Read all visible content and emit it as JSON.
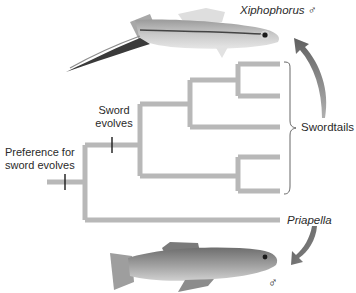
{
  "diagram": {
    "type": "phylogenetic-tree",
    "labels": {
      "top_species": "Xiphophorus ♂",
      "bottom_species": "Priapella",
      "bottom_sex": "♂",
      "clade": "Swordtails",
      "sword_event": [
        "Sword",
        "evolves"
      ],
      "preference_event": [
        "Preference for",
        "sword evolves"
      ]
    },
    "tree": {
      "root_event": "Preference for sword evolves",
      "children": [
        {
          "name": "Swordtails",
          "event": "Sword evolves",
          "taxa_count": 5
        },
        {
          "name": "Priapella"
        }
      ]
    },
    "images": {
      "top": "swordtail-fish-photo",
      "bottom": "priapella-fish-photo"
    },
    "colors": {
      "branch": "#b8b8b8",
      "arrow": "#7a7a7a",
      "text": "#2a2a2a"
    }
  }
}
